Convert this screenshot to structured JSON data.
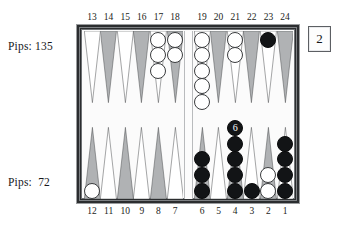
{
  "app": {
    "title": "Backgammon Board Position",
    "type": "backgammon-board-diagram"
  },
  "pips": {
    "top_label": "Pips: 135",
    "top_player": "white",
    "top_value": 135,
    "bottom_label": "Pips:  72",
    "bottom_player": "black",
    "bottom_value": 72
  },
  "doubling_cube": {
    "value": "2",
    "label": "2"
  },
  "colors": {
    "board_frame": "#2b2d2f",
    "board_field": "#fbfbfb",
    "point_light": "#ffffff",
    "point_dark": "#b0b2b4",
    "point_outline": "#4a4c4e",
    "checker_white": "#ffffff",
    "checker_black": "#121416",
    "text": "#16181a"
  },
  "point_numbers": {
    "top_left": [
      "13",
      "14",
      "15",
      "16",
      "17",
      "18"
    ],
    "top_right": [
      "19",
      "20",
      "21",
      "22",
      "23",
      "24"
    ],
    "bottom_left": [
      "12",
      "11",
      "10",
      "9",
      "8",
      "7"
    ],
    "bottom_right": [
      "6",
      "5",
      "4",
      "3",
      "2",
      "1"
    ]
  },
  "points": [
    {
      "number": "1",
      "quadrant": "bottom-right",
      "slot": 5,
      "shade": "light",
      "checkers": 4,
      "color": "black",
      "label": ""
    },
    {
      "number": "2",
      "quadrant": "bottom-right",
      "slot": 4,
      "shade": "dark",
      "checkers": 2,
      "color": "white",
      "label": ""
    },
    {
      "number": "3",
      "quadrant": "bottom-right",
      "slot": 3,
      "shade": "light",
      "checkers": 1,
      "color": "black",
      "label": ""
    },
    {
      "number": "4",
      "quadrant": "bottom-right",
      "slot": 2,
      "shade": "dark",
      "checkers": 6,
      "color": "black",
      "label": "6"
    },
    {
      "number": "5",
      "quadrant": "bottom-right",
      "slot": 1,
      "shade": "light",
      "checkers": 0,
      "color": "none",
      "label": ""
    },
    {
      "number": "6",
      "quadrant": "bottom-right",
      "slot": 0,
      "shade": "dark",
      "checkers": 3,
      "color": "black",
      "label": ""
    },
    {
      "number": "7",
      "quadrant": "bottom-left",
      "slot": 5,
      "shade": "light",
      "checkers": 0,
      "color": "none",
      "label": ""
    },
    {
      "number": "8",
      "quadrant": "bottom-left",
      "slot": 4,
      "shade": "dark",
      "checkers": 0,
      "color": "none",
      "label": ""
    },
    {
      "number": "9",
      "quadrant": "bottom-left",
      "slot": 3,
      "shade": "light",
      "checkers": 0,
      "color": "none",
      "label": ""
    },
    {
      "number": "10",
      "quadrant": "bottom-left",
      "slot": 2,
      "shade": "dark",
      "checkers": 0,
      "color": "none",
      "label": ""
    },
    {
      "number": "11",
      "quadrant": "bottom-left",
      "slot": 1,
      "shade": "light",
      "checkers": 0,
      "color": "none",
      "label": ""
    },
    {
      "number": "12",
      "quadrant": "bottom-left",
      "slot": 0,
      "shade": "dark",
      "checkers": 1,
      "color": "white",
      "label": ""
    },
    {
      "number": "13",
      "quadrant": "top-left",
      "slot": 0,
      "shade": "light",
      "checkers": 0,
      "color": "none",
      "label": ""
    },
    {
      "number": "14",
      "quadrant": "top-left",
      "slot": 1,
      "shade": "dark",
      "checkers": 0,
      "color": "none",
      "label": ""
    },
    {
      "number": "15",
      "quadrant": "top-left",
      "slot": 2,
      "shade": "light",
      "checkers": 0,
      "color": "none",
      "label": ""
    },
    {
      "number": "16",
      "quadrant": "top-left",
      "slot": 3,
      "shade": "dark",
      "checkers": 0,
      "color": "none",
      "label": ""
    },
    {
      "number": "17",
      "quadrant": "top-left",
      "slot": 4,
      "shade": "light",
      "checkers": 3,
      "color": "white",
      "label": ""
    },
    {
      "number": "18",
      "quadrant": "top-left",
      "slot": 5,
      "shade": "dark",
      "checkers": 2,
      "color": "white",
      "label": ""
    },
    {
      "number": "19",
      "quadrant": "top-right",
      "slot": 0,
      "shade": "light",
      "checkers": 5,
      "color": "white",
      "label": ""
    },
    {
      "number": "20",
      "quadrant": "top-right",
      "slot": 1,
      "shade": "dark",
      "checkers": 0,
      "color": "none",
      "label": ""
    },
    {
      "number": "21",
      "quadrant": "top-right",
      "slot": 2,
      "shade": "light",
      "checkers": 2,
      "color": "white",
      "label": ""
    },
    {
      "number": "22",
      "quadrant": "top-right",
      "slot": 3,
      "shade": "dark",
      "checkers": 0,
      "color": "none",
      "label": ""
    },
    {
      "number": "23",
      "quadrant": "top-right",
      "slot": 4,
      "shade": "light",
      "checkers": 1,
      "color": "black",
      "label": ""
    },
    {
      "number": "24",
      "quadrant": "top-right",
      "slot": 5,
      "shade": "dark",
      "checkers": 0,
      "color": "none",
      "label": ""
    }
  ],
  "bar": {
    "white_checkers": 0,
    "black_checkers": 0
  }
}
